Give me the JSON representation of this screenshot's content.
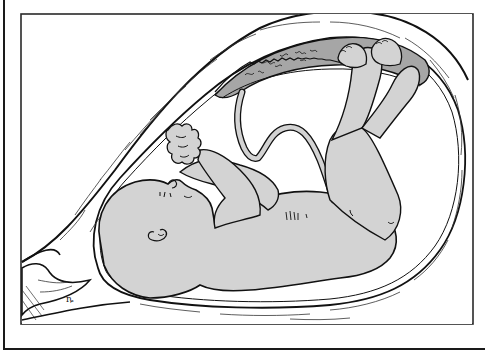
{
  "figure": {
    "frame": {
      "x": 20,
      "y": 13,
      "width": 453,
      "height": 311
    },
    "colors": {
      "line": "#111111",
      "skin": "#d3d3d3",
      "placenta": "#a6a6a6",
      "wall": "#ffffff",
      "background": "#ffffff"
    },
    "regions": [
      {
        "id": "uterine-wall",
        "label": ""
      },
      {
        "id": "placenta",
        "label": ""
      },
      {
        "id": "amniotic-sac",
        "label": ""
      },
      {
        "id": "fetus",
        "label": ""
      },
      {
        "id": "umbilical-cord",
        "label": ""
      },
      {
        "id": "cervix",
        "label": ""
      }
    ]
  }
}
